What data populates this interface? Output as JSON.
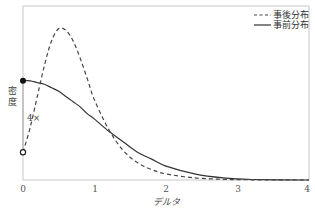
{
  "chart_data": {
    "type": "line",
    "title": "",
    "xlabel": "デルタ",
    "ylabel": "密度",
    "xlim": [
      0,
      4
    ],
    "ylim": [
      0,
      1
    ],
    "x_ticks": [
      "0",
      "1",
      "2",
      "3",
      "4"
    ],
    "grid": false,
    "legend_position": "upper right",
    "annotation": "4×",
    "series": [
      {
        "name": "事後分布",
        "style": "dashed",
        "x": [
          0,
          0.1,
          0.2,
          0.3,
          0.4,
          0.5,
          0.6,
          0.7,
          0.8,
          0.9,
          1.0,
          1.2,
          1.4,
          1.6,
          1.8,
          2.0,
          2.4,
          2.8,
          3.2,
          4.0
        ],
        "y": [
          0.16,
          0.3,
          0.48,
          0.66,
          0.8,
          0.87,
          0.86,
          0.8,
          0.7,
          0.58,
          0.46,
          0.29,
          0.17,
          0.1,
          0.06,
          0.035,
          0.012,
          0.004,
          0.001,
          0.0
        ]
      },
      {
        "name": "事前分布",
        "style": "solid",
        "x": [
          0,
          0.1,
          0.2,
          0.3,
          0.4,
          0.5,
          0.6,
          0.7,
          0.8,
          0.9,
          1.0,
          1.2,
          1.4,
          1.6,
          1.8,
          2.0,
          2.4,
          2.8,
          3.2,
          4.0
        ],
        "y": [
          0.57,
          0.57,
          0.56,
          0.55,
          0.53,
          0.51,
          0.48,
          0.45,
          0.42,
          0.38,
          0.35,
          0.28,
          0.22,
          0.16,
          0.12,
          0.08,
          0.035,
          0.012,
          0.003,
          0.0
        ]
      }
    ],
    "markers": [
      {
        "name": "prior-density-at-zero",
        "x": 0,
        "y": 0.57,
        "style": "filled"
      },
      {
        "name": "posterior-density-at-zero",
        "x": 0,
        "y": 0.16,
        "style": "open"
      }
    ]
  },
  "legend": {
    "posterior": "事後分布",
    "prior": "事前分布"
  },
  "axes": {
    "ylabel_line1": "密",
    "ylabel_line2": "度",
    "xlabel": "デルタ",
    "ratio_annotation": "4×",
    "x_ticks": [
      "0",
      "1",
      "2",
      "3",
      "4"
    ]
  }
}
